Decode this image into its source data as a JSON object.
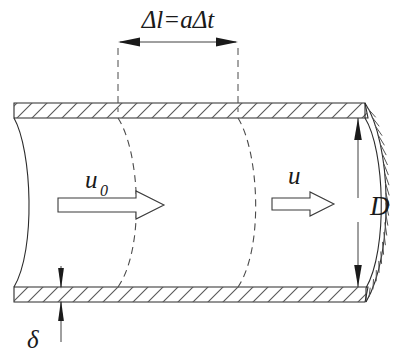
{
  "figure": {
    "type": "engineering-cross-section"
  },
  "colors": {
    "line": "#2b2b2b",
    "hatch": "#555555",
    "dash": "#4a4a4a",
    "background": "#ffffff",
    "label": "#1a1a1a"
  },
  "labels": {
    "delta_l": "Δl=aΔt",
    "u_zero_base": "u",
    "u_zero_sub": "0",
    "u": "u",
    "diameter": "D",
    "wall_thickness": "δ"
  },
  "geometry": {
    "pipe": {
      "left_x": 14,
      "right_x": 365,
      "outer_top_y": 103,
      "inner_top_y": 118,
      "inner_bottom_y": 287,
      "outer_bottom_y": 302,
      "wall_thickness_px": 15
    },
    "dimension_delta_l": {
      "left_x": 118,
      "right_x": 238,
      "line_y": 42,
      "ext_top_y": 48,
      "ext_bottom_y": 110
    },
    "dimension_D": {
      "x": 358,
      "top_y": 110,
      "bottom_y": 295
    },
    "dimension_delta": {
      "x": 61,
      "top_y": 268,
      "bottom_y": 340
    },
    "wave_fronts_mid_x": [
      143,
      262
    ],
    "fluid_front_mid_x": 35,
    "end_cap_bulge_x": 395
  },
  "annotations": {
    "arrow_u0": {
      "x": 92,
      "y": 204,
      "length": 78
    },
    "arrow_u": {
      "x": 277,
      "y": 203,
      "length": 56
    },
    "label_u0": {
      "x": 92,
      "y": 185
    },
    "label_u": {
      "x": 295,
      "y": 180
    },
    "label_D": {
      "x": 371,
      "y": 212
    },
    "label_delta": {
      "x": 28,
      "y": 345
    },
    "label_delta_l": {
      "x": 178,
      "y": 26
    }
  }
}
